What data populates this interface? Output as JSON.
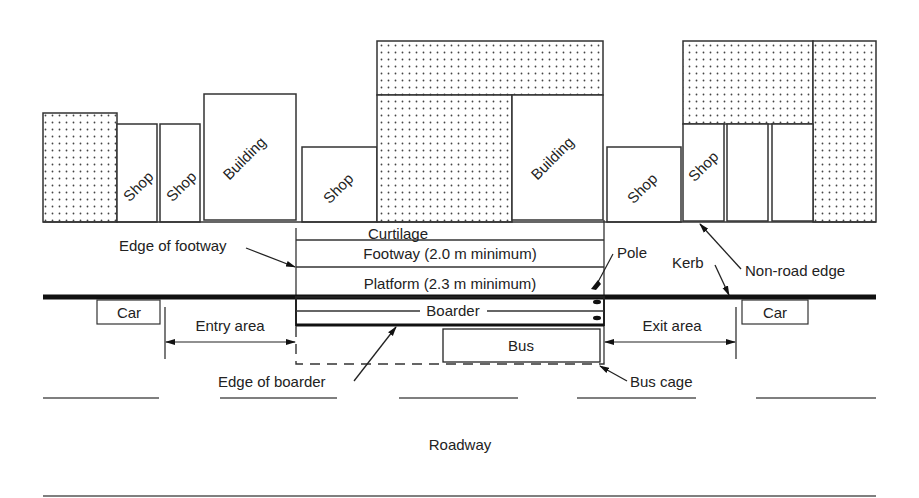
{
  "diagram": {
    "buildings": [
      {
        "id": "b1",
        "label": "",
        "pattern": "dotted"
      },
      {
        "id": "b2",
        "label": "Shop",
        "pattern": "plain"
      },
      {
        "id": "b3",
        "label": "Shop",
        "pattern": "plain"
      },
      {
        "id": "b4",
        "label": "Building",
        "pattern": "plain"
      },
      {
        "id": "b5",
        "label": "Shop",
        "pattern": "plain"
      },
      {
        "id": "b6",
        "label": "",
        "pattern": "dotted"
      },
      {
        "id": "b7",
        "label": "Building",
        "pattern": "plain"
      },
      {
        "id": "b8",
        "label": "Shop",
        "pattern": "plain"
      },
      {
        "id": "b9",
        "label": "Shop",
        "pattern": "plain"
      },
      {
        "id": "b10",
        "label": "",
        "pattern": "plain"
      },
      {
        "id": "b11",
        "label": "Shop",
        "pattern": "plain"
      },
      {
        "id": "b12",
        "label": "",
        "pattern": "dotted"
      }
    ],
    "zones": {
      "curtilage": "Curtilage",
      "footway": "Footway (2.0 m minimum)",
      "platform": "Platform (2.3 m minimum)",
      "boarder": "Boarder",
      "bus": "Bus",
      "entry_area": "Entry area",
      "exit_area": "Exit area",
      "roadway": "Roadway"
    },
    "vehicles": {
      "car_left": "Car",
      "car_right": "Car"
    },
    "callouts": {
      "edge_of_footway": "Edge of footway",
      "pole": "Pole",
      "kerb": "Kerb",
      "non_road_edge": "Non-road edge",
      "edge_of_boarder": "Edge of boarder",
      "bus_cage": "Bus cage"
    }
  }
}
